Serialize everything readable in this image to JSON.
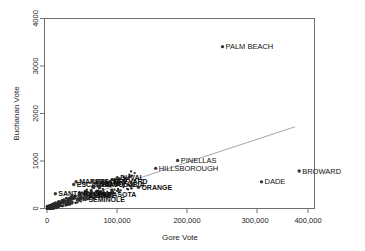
{
  "chart_data": {
    "type": "scatter",
    "title": "",
    "xlabel": "Gore Vote",
    "ylabel": "Buchanan Vote",
    "xlim": [
      0,
      425000
    ],
    "ylim": [
      0,
      4300
    ],
    "xticks": [
      0,
      100000,
      200000,
      300000,
      400000
    ],
    "xticklabels": [
      "0",
      "100,000",
      "200,000",
      "300,000",
      "400,000"
    ],
    "yticks": [
      0,
      1000,
      2000,
      3000,
      4000
    ],
    "yticklabels": [
      "0",
      "1000",
      "2000",
      "3000",
      "4000"
    ],
    "grid": false,
    "legend": null,
    "point_color": "#3a3a3a",
    "fitline_color": "#9a9a9a",
    "fitline": {
      "x0": 0,
      "y0": 0,
      "x1": 380000,
      "y1": 1720
    },
    "labeled_points": [
      {
        "name": "PALM BEACH",
        "gore": 268945,
        "buchanan": 3407,
        "label_side": "right"
      },
      {
        "name": "BROWARD",
        "gore": 386518,
        "buchanan": 789,
        "label_side": "right"
      },
      {
        "name": "DADE",
        "gore": 328702,
        "buchanan": 561,
        "label_side": "right"
      },
      {
        "name": "PINELLAS",
        "gore": 200212,
        "buchanan": 1010,
        "label_side": "right"
      },
      {
        "name": "HILLSBOROUGH",
        "gore": 166581,
        "buchanan": 845,
        "label_side": "right"
      },
      {
        "name": "DUVAL",
        "gore": 107680,
        "buchanan": 650,
        "label_side": "right"
      },
      {
        "name": "POLK",
        "gore": 75200,
        "buchanan": 534,
        "label_side": "right"
      },
      {
        "name": "ORANGE",
        "gore": 140115,
        "buchanan": 446,
        "label_side": "right"
      },
      {
        "name": "VOLUSIA",
        "gore": 97063,
        "buchanan": 498,
        "label_side": "right"
      },
      {
        "name": "BREVARD",
        "gore": 97318,
        "buchanan": 570,
        "label_side": "right"
      },
      {
        "name": "MARION",
        "gore": 44648,
        "buchanan": 563,
        "label_side": "right"
      },
      {
        "name": "ESCAMBIA",
        "gore": 40943,
        "buchanan": 504,
        "label_side": "right"
      },
      {
        "name": "SANTA ROSA",
        "gore": 12795,
        "buchanan": 311,
        "label_side": "right"
      },
      {
        "name": "SARASOTA",
        "gore": 72854,
        "buchanan": 305,
        "label_side": "right"
      },
      {
        "name": "PASCO",
        "gore": 69550,
        "buchanan": 570,
        "label_side": "right"
      },
      {
        "name": "SEMINOLE",
        "gore": 58888,
        "buchanan": 194,
        "label_side": "right"
      },
      {
        "name": "LEON",
        "gore": 61425,
        "buchanan": 282,
        "label_side": "right"
      },
      {
        "name": "LEE",
        "gore": 73560,
        "buchanan": 305,
        "label_side": "right"
      },
      {
        "name": "MANATEE",
        "gore": 49169,
        "buchanan": 272,
        "label_side": "right"
      }
    ],
    "cluster_note": "dense overplotted mass of Florida counties near origin"
  },
  "axes": {
    "x_axis_title": "Gore Vote",
    "y_axis_title": "Buchanan Vote"
  }
}
